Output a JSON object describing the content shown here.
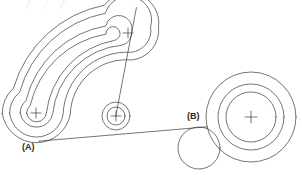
{
  "drawing": {
    "title": "Curved slot and circular bosses technical line drawing",
    "background_color": "#ffffff",
    "line_color": "#3a3a3a",
    "line_width": 0.7,
    "canvas": {
      "width": 302,
      "height": 175
    },
    "labels": [
      {
        "id": "A",
        "text": "(A)",
        "x": 22,
        "y": 143
      },
      {
        "id": "B",
        "text": "(B)",
        "x": 187,
        "y": 112
      }
    ],
    "features": {
      "curved_slot": {
        "name": "curved-slot",
        "description": "Arc shaped obround slot with inner and outer offset contours",
        "arc_center": {
          "x": 131,
          "y": 117
        },
        "left_end_center": {
          "x": 36,
          "y": 113
        },
        "right_end_center": {
          "x": 128,
          "y": 33
        },
        "contours": [
          {
            "name": "outer-contour",
            "offset": 34
          },
          {
            "name": "mid-outer-contour",
            "offset": 26
          },
          {
            "name": "mid-inner-contour",
            "offset": 16
          },
          {
            "name": "inner-contour",
            "offset": 9
          }
        ]
      },
      "left_end_cross": {
        "name": "left-end-center-mark",
        "x": 36,
        "y": 113,
        "size": 5
      },
      "right_end_cross": {
        "name": "right-end-center-mark",
        "x": 128,
        "y": 33,
        "size": 5
      },
      "middle_boss": {
        "name": "middle-concentric-circles",
        "center": {
          "x": 116,
          "y": 116
        },
        "radii": [
          14,
          9
        ],
        "cross_size": 5
      },
      "right_boss": {
        "name": "right-concentric-circles",
        "center": {
          "x": 251,
          "y": 117
        },
        "radii": [
          45,
          33,
          25
        ],
        "cross_size": 6
      },
      "small_circle_b": {
        "name": "small-circle-b",
        "center": {
          "x": 199,
          "y": 148
        },
        "radius": 21
      },
      "leader_lines": [
        {
          "name": "leader-a-to-b",
          "x1": 38,
          "y1": 141,
          "x2": 207,
          "y2": 127
        },
        {
          "name": "leader-middle-to-top",
          "x1": 116,
          "y1": 116,
          "x2": 136,
          "y2": 8
        }
      ]
    }
  }
}
